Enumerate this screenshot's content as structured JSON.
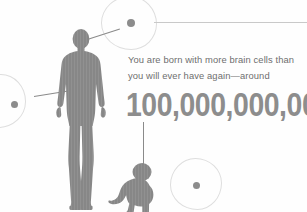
{
  "canvas": {
    "width": 307,
    "height": 212,
    "background": "#fefefe"
  },
  "palette": {
    "silhouette_gray": "#878787",
    "silhouette_stripe": "#8f8f8f",
    "body_text": "#6e6e6e",
    "number_text": "#8d8d8d",
    "cell_outline": "#dedede",
    "nucleus": "#8c8c8c",
    "leader_line": "#8a8a8a",
    "leader_line_thin": "#c9c9c9",
    "leader_dot": "#2e2e2e"
  },
  "content": {
    "body_text": "You are born with more brain cells than\nyou will ever have again—around",
    "big_number": "100,000,000,000",
    "edge_caption": ""
  },
  "figures": {
    "adult": {
      "name": "adult-human-silhouette",
      "x": 50,
      "y": 28,
      "width": 62,
      "height": 184
    },
    "baby": {
      "name": "crawling-baby-silhouette",
      "x": 108,
      "y": 160,
      "width": 52,
      "height": 52
    }
  },
  "cells": [
    {
      "name": "brain-cell-callout-top",
      "x": 101,
      "y": -4,
      "size": 54,
      "nucleus_size": 8,
      "nucleus_dx": 25,
      "nucleus_dy": 22
    },
    {
      "name": "brain-cell-callout-left",
      "x": -28,
      "y": 74,
      "size": 52,
      "nucleus_size": 7,
      "nucleus_dx": 38,
      "nucleus_dy": 26
    },
    {
      "name": "brain-cell-callout-bottom",
      "x": 170,
      "y": 158,
      "size": 50,
      "nucleus_size": 7,
      "nucleus_dx": 22,
      "nucleus_dy": 23
    }
  ],
  "connectors": [
    {
      "name": "connector-head-to-top-cell",
      "from": "adult-head",
      "to": "brain-cell-callout-top"
    },
    {
      "name": "connector-chest-to-left-cell",
      "from": "adult-chest",
      "to": "brain-cell-callout-left"
    },
    {
      "name": "connector-number-to-baby-head",
      "from": "big-number",
      "to": "baby-head"
    },
    {
      "name": "connector-top-cell-to-right-edge",
      "from": "brain-cell-callout-top",
      "to": "right-edge"
    }
  ]
}
